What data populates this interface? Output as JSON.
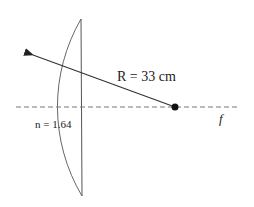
{
  "diagram": {
    "type": "optics-lens",
    "labels": {
      "radius": "R = 33 cm",
      "index": "n = 1.64",
      "focal": "f"
    },
    "colors": {
      "stroke": "#555555",
      "arrow": "#333333",
      "dash": "#777777",
      "dot": "#111111"
    }
  }
}
